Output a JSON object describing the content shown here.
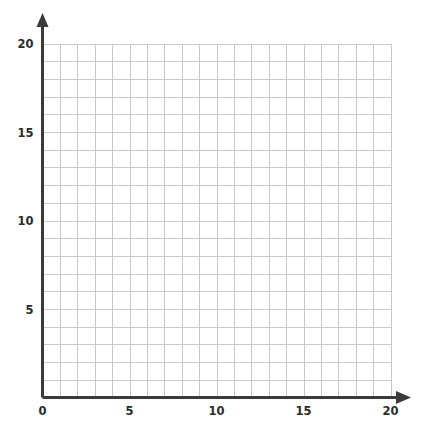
{
  "chart_data": {
    "type": "scatter",
    "title": "",
    "subtitle": "",
    "xlabel": "",
    "ylabel": "",
    "xlim": [
      0,
      20
    ],
    "ylim": [
      0,
      20
    ],
    "grid": true,
    "grid_step": 1,
    "legend": null,
    "annotations": [],
    "series": [],
    "x": [],
    "values": [],
    "x_ticks": [
      {
        "value": 0,
        "label": "0"
      },
      {
        "value": 5,
        "label": "5"
      },
      {
        "value": 10,
        "label": "10"
      },
      {
        "value": 15,
        "label": "15"
      },
      {
        "value": 20,
        "label": "20"
      }
    ],
    "y_ticks": [
      {
        "value": 5,
        "label": "5"
      },
      {
        "value": 10,
        "label": "10"
      },
      {
        "value": 15,
        "label": "15"
      },
      {
        "value": 20,
        "label": "20"
      }
    ],
    "colors": {
      "background": "#ffffff",
      "grid_line": "#c9c9c9",
      "axis_line": "#3a3a3a",
      "tick_text": "#2b2b2b"
    }
  }
}
